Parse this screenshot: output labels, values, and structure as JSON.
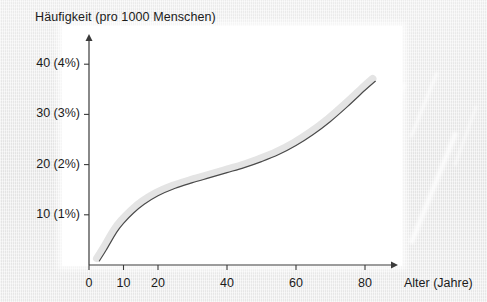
{
  "figure": {
    "background_color": "#ececec",
    "plot_background_color": "#ffffff",
    "line_color": "#4a4a4a",
    "band_color": "#e3e3e3",
    "axis_color": "#3a3a3a"
  },
  "chart_data": {
    "type": "line",
    "title": "Häufigkeit (pro 1000 Menschen)",
    "xlabel": "Alter (Jahre)",
    "ylabel": "Häufigkeit (pro 1000 Menschen)",
    "xlim": [
      0,
      90
    ],
    "ylim": [
      0,
      45
    ],
    "grid": false,
    "legend": null,
    "x_ticks": [
      {
        "value": 0,
        "label": "0"
      },
      {
        "value": 10,
        "label": "10"
      },
      {
        "value": 20,
        "label": "20"
      },
      {
        "value": 40,
        "label": "40"
      },
      {
        "value": 60,
        "label": "60"
      },
      {
        "value": 80,
        "label": "80"
      }
    ],
    "y_ticks": [
      {
        "value": 10,
        "label": "10 (1%)"
      },
      {
        "value": 20,
        "label": "20 (2%)"
      },
      {
        "value": 30,
        "label": "30 (3%)"
      },
      {
        "value": 40,
        "label": "40 (4%)"
      }
    ],
    "series": [
      {
        "name": "Häufigkeit",
        "style": "solid-line-with-shadow-band",
        "x": [
          3,
          5,
          8,
          10,
          13,
          16,
          20,
          25,
          30,
          35,
          40,
          45,
          50,
          55,
          60,
          65,
          70,
          75,
          80,
          83
        ],
        "y": [
          0.8,
          3.0,
          6.5,
          8.3,
          10.4,
          12.1,
          13.8,
          15.3,
          16.4,
          17.4,
          18.4,
          19.4,
          20.6,
          22.0,
          23.8,
          26.0,
          28.6,
          31.6,
          34.8,
          36.6
        ]
      }
    ],
    "annotations": []
  }
}
